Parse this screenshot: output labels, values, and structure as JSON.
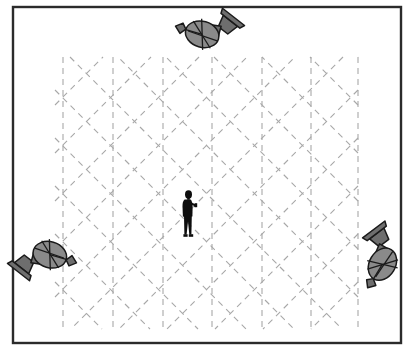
{
  "figure": {
    "title": "Indoor localization scene with three fixed antenna stations and one mobile user",
    "caption": "",
    "background_color": "#ffffff",
    "canvas": {
      "width": 417,
      "height": 355
    }
  },
  "frame": {
    "name": "scene-border",
    "label": "Scene boundary",
    "x": 13,
    "y": 7,
    "width": 388,
    "height": 336,
    "stroke_color": "#2b2b2b",
    "stroke_width": 2.4,
    "fill_color": "#ffffff"
  },
  "grid": {
    "label": "Signal ray grid",
    "line_color": "#a8a8a8",
    "line_width": 1.1,
    "dash_pattern": "6 5",
    "region": {
      "x": 55,
      "y": 57,
      "width": 303,
      "height": 272
    },
    "vertical_lines_x": [
      63,
      113,
      163,
      212,
      262,
      311,
      358
    ],
    "diagonal_up_count": 11,
    "diagonal_down_count": 11,
    "diagonal_spacing": 48,
    "diagonal_angle_deg": 45
  },
  "antennas": [
    {
      "id": "antenna-top",
      "name": "satellite-dish-icon-top",
      "label": "Antenna station A (top)",
      "x": 209,
      "y": 32,
      "rotation_deg": 218,
      "scale": 1.0,
      "body_color": "#6e6e6e",
      "dish_color": "#8a8a8a",
      "outline_color": "#1a1a1a"
    },
    {
      "id": "antenna-bottom-left",
      "name": "satellite-dish-icon-bottom-left",
      "label": "Antenna station B (bottom left)",
      "x": 43,
      "y": 257,
      "rotation_deg": 38,
      "scale": 1.0,
      "body_color": "#6e6e6e",
      "dish_color": "#8a8a8a",
      "outline_color": "#1a1a1a"
    },
    {
      "id": "antenna-bottom-right",
      "name": "satellite-dish-icon-bottom-right",
      "label": "Antenna station C (bottom right)",
      "x": 382,
      "y": 257,
      "rotation_deg": 143,
      "scale": 1.0,
      "body_color": "#6e6e6e",
      "dish_color": "#8a8a8a",
      "outline_color": "#1a1a1a"
    }
  ],
  "person": {
    "id": "mobile-user",
    "name": "person-silhouette",
    "label": "Mobile user holding handheld device",
    "x": 179,
    "y": 190,
    "height": 48,
    "color": "#0d0d0d",
    "holding_device": true
  },
  "chart_data": {
    "type": "scatter",
    "title": "Indoor localization scene with three fixed antenna stations and one mobile user",
    "xlabel": "",
    "ylabel": "",
    "xlim": [
      13,
      401
    ],
    "ylim": [
      7,
      343
    ],
    "grid": true,
    "legend_position": "none",
    "categories": [
      "antenna",
      "user"
    ],
    "series": [
      {
        "name": "antenna",
        "points": [
          {
            "label": "Antenna station A (top)",
            "x": 209,
            "y": 32
          },
          {
            "label": "Antenna station B (bottom left)",
            "x": 43,
            "y": 257
          },
          {
            "label": "Antenna station C (bottom right)",
            "x": 382,
            "y": 257
          }
        ]
      },
      {
        "name": "user",
        "points": [
          {
            "label": "Mobile user",
            "x": 179,
            "y": 214
          }
        ]
      }
    ],
    "annotations": [
      {
        "text": "Signal ray grid",
        "type": "dashed-line-field",
        "angle_deg": [
          90,
          45,
          -45
        ]
      }
    ]
  }
}
